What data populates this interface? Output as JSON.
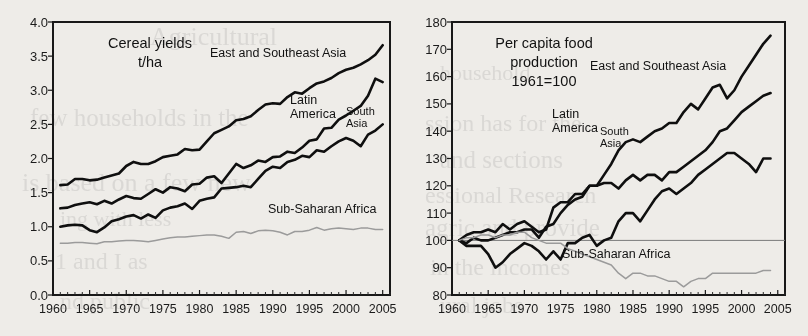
{
  "page": {
    "background_color": "#eceae6",
    "line_color_dark": "#111111",
    "line_color_light": "#9a9a9a"
  },
  "bleed_text": [
    {
      "text": "Agricultural",
      "x": 150,
      "y": 22,
      "size": 26
    },
    {
      "text": "few households in the",
      "x": 30,
      "y": 104,
      "size": 25
    },
    {
      "text": "is based on a few new",
      "x": 22,
      "y": 168,
      "size": 26
    },
    {
      "text": "ing with less",
      "x": 60,
      "y": 206,
      "size": 22
    },
    {
      "text": "1 and I as",
      "x": 55,
      "y": 248,
      "size": 24
    },
    {
      "text": "nd public",
      "x": 60,
      "y": 288,
      "size": 24
    },
    {
      "text": "household",
      "x": 440,
      "y": 60,
      "size": 22
    },
    {
      "text": "ssion has for the",
      "x": 425,
      "y": 110,
      "size": 24
    },
    {
      "text": "and sections",
      "x": 440,
      "y": 146,
      "size": 25
    },
    {
      "text": "essional Research",
      "x": 425,
      "y": 182,
      "size": 24
    },
    {
      "text": "agric and provide",
      "x": 425,
      "y": 214,
      "size": 25
    },
    {
      "text": "in the incomes",
      "x": 430,
      "y": 254,
      "size": 24
    },
    {
      "text": "ural jobs",
      "x": 440,
      "y": 292,
      "size": 24
    }
  ],
  "charts": [
    {
      "name": "cereal-yields-chart",
      "title_lines": [
        "Cereal yields",
        "t/ha"
      ],
      "ylabels": [
        "4.0",
        "3.5",
        "3.0",
        "2.5",
        "2.0",
        "1.5",
        "1.0",
        "0.5",
        "0.0"
      ],
      "xlabels": [
        "1960",
        "1965",
        "1970",
        "1975",
        "1980",
        "1985",
        "1990",
        "1995",
        "2000",
        "2005"
      ],
      "series_labels": [
        {
          "name": "east-southeast-asia",
          "lines": [
            "East and Southeast Asia"
          ]
        },
        {
          "name": "latin-america",
          "lines": [
            "Latin",
            "America"
          ]
        },
        {
          "name": "south-asia",
          "lines": [
            "South",
            "Asia"
          ]
        },
        {
          "name": "sub-saharan-africa",
          "lines": [
            "Sub-Saharan Africa"
          ]
        }
      ]
    },
    {
      "name": "per-capita-food-production-chart",
      "title_lines": [
        "Per capita food",
        "production",
        "1961=100"
      ],
      "ylabels": [
        "180",
        "170",
        "160",
        "150",
        "140",
        "130",
        "120",
        "110",
        "100",
        "90",
        "80"
      ],
      "xlabels": [
        "1960",
        "1965",
        "1970",
        "1975",
        "1980",
        "1985",
        "1990",
        "1995",
        "2000",
        "2005"
      ],
      "series_labels": [
        {
          "name": "east-southeast-asia",
          "lines": [
            "East and Southeast Asia"
          ]
        },
        {
          "name": "latin-america",
          "lines": [
            "Latin",
            "America"
          ]
        },
        {
          "name": "south-asia",
          "lines": [
            "South",
            "Asia"
          ]
        },
        {
          "name": "sub-saharan-africa",
          "lines": [
            "Sub-Saharan Africa"
          ]
        }
      ]
    }
  ],
  "chart_data": [
    {
      "type": "line",
      "title": "Cereal yields t/ha",
      "xlabel": "",
      "ylabel": "t/ha",
      "xlim": [
        1960,
        2006
      ],
      "ylim": [
        0.0,
        4.0
      ],
      "yticks": [
        0.0,
        0.5,
        1.0,
        1.5,
        2.0,
        2.5,
        3.0,
        3.5,
        4.0
      ],
      "xticks": [
        1960,
        1965,
        1970,
        1975,
        1980,
        1985,
        1990,
        1995,
        2000,
        2005
      ],
      "grid": false,
      "legend": "inline-annotations",
      "x": [
        1961,
        1962,
        1963,
        1964,
        1965,
        1966,
        1967,
        1968,
        1969,
        1970,
        1971,
        1972,
        1973,
        1974,
        1975,
        1976,
        1977,
        1978,
        1979,
        1980,
        1981,
        1982,
        1983,
        1984,
        1985,
        1986,
        1987,
        1988,
        1989,
        1990,
        1991,
        1992,
        1993,
        1994,
        1995,
        1996,
        1997,
        1998,
        1999,
        2000,
        2001,
        2002,
        2003,
        2004,
        2005
      ],
      "series": [
        {
          "name": "East and Southeast Asia",
          "color": "#111111",
          "values": [
            1.61,
            1.62,
            1.7,
            1.7,
            1.68,
            1.69,
            1.72,
            1.75,
            1.78,
            1.89,
            1.95,
            1.92,
            1.92,
            1.96,
            2.02,
            2.04,
            2.06,
            2.14,
            2.12,
            2.13,
            2.25,
            2.37,
            2.42,
            2.47,
            2.56,
            2.58,
            2.62,
            2.71,
            2.79,
            2.81,
            2.8,
            2.9,
            2.97,
            2.95,
            3.03,
            3.1,
            3.13,
            3.18,
            3.25,
            3.3,
            3.33,
            3.38,
            3.44,
            3.52,
            3.66
          ]
        },
        {
          "name": "Latin America",
          "color": "#111111",
          "values": [
            1.27,
            1.28,
            1.32,
            1.34,
            1.36,
            1.33,
            1.38,
            1.34,
            1.4,
            1.45,
            1.42,
            1.41,
            1.48,
            1.55,
            1.5,
            1.58,
            1.56,
            1.52,
            1.62,
            1.63,
            1.72,
            1.74,
            1.64,
            1.78,
            1.92,
            1.86,
            1.9,
            1.97,
            1.95,
            2.02,
            2.03,
            2.1,
            2.08,
            2.16,
            2.26,
            2.28,
            2.44,
            2.45,
            2.57,
            2.63,
            2.7,
            2.77,
            2.92,
            3.17,
            3.12
          ]
        },
        {
          "name": "South Asia",
          "color": "#111111",
          "values": [
            1.0,
            1.02,
            1.03,
            1.02,
            0.95,
            0.92,
            0.99,
            1.08,
            1.11,
            1.15,
            1.17,
            1.12,
            1.18,
            1.13,
            1.24,
            1.28,
            1.3,
            1.34,
            1.26,
            1.38,
            1.41,
            1.43,
            1.56,
            1.57,
            1.58,
            1.6,
            1.58,
            1.7,
            1.82,
            1.88,
            1.86,
            1.95,
            1.98,
            2.04,
            2.02,
            2.12,
            2.1,
            2.18,
            2.25,
            2.3,
            2.26,
            2.18,
            2.35,
            2.41,
            2.5
          ]
        },
        {
          "name": "Sub-Saharan Africa",
          "color": "#9a9a9a",
          "values": [
            0.76,
            0.76,
            0.77,
            0.77,
            0.76,
            0.75,
            0.78,
            0.78,
            0.79,
            0.8,
            0.8,
            0.79,
            0.78,
            0.8,
            0.82,
            0.84,
            0.85,
            0.85,
            0.86,
            0.87,
            0.88,
            0.88,
            0.86,
            0.83,
            0.92,
            0.93,
            0.9,
            0.94,
            0.95,
            0.94,
            0.92,
            0.88,
            0.93,
            0.93,
            0.95,
            0.99,
            0.95,
            0.97,
            0.98,
            0.97,
            0.96,
            0.98,
            0.98,
            0.96,
            0.96
          ]
        }
      ]
    },
    {
      "type": "line",
      "title": "Per capita food production 1961=100",
      "xlabel": "",
      "ylabel": "Index, 1961=100",
      "xlim": [
        1960,
        2006
      ],
      "ylim": [
        80,
        180
      ],
      "yticks": [
        80,
        90,
        100,
        110,
        120,
        130,
        140,
        150,
        160,
        170,
        180
      ],
      "xticks": [
        1960,
        1965,
        1970,
        1975,
        1980,
        1985,
        1990,
        1995,
        2000,
        2005
      ],
      "grid": false,
      "reference_line": 100,
      "legend": "inline-annotations",
      "x": [
        1961,
        1962,
        1963,
        1964,
        1965,
        1966,
        1967,
        1968,
        1969,
        1970,
        1971,
        1972,
        1973,
        1974,
        1975,
        1976,
        1977,
        1978,
        1979,
        1980,
        1981,
        1982,
        1983,
        1984,
        1985,
        1986,
        1987,
        1988,
        1989,
        1990,
        1991,
        1992,
        1993,
        1994,
        1995,
        1996,
        1997,
        1998,
        1999,
        2000,
        2001,
        2002,
        2003,
        2004
      ],
      "series": [
        {
          "name": "East and Southeast Asia",
          "color": "#111111",
          "values": [
            100,
            99,
            101,
            100,
            100,
            101,
            102,
            103,
            103,
            104,
            104,
            101,
            105,
            106,
            110,
            113,
            115,
            116,
            120,
            120,
            124,
            128,
            133,
            136,
            137,
            136,
            138,
            140,
            141,
            143,
            143,
            147,
            150,
            148,
            152,
            156,
            157,
            152,
            155,
            160,
            164,
            168,
            172,
            175
          ]
        },
        {
          "name": "Latin America",
          "color": "#111111",
          "values": [
            100,
            102,
            103,
            103,
            104,
            103,
            106,
            104,
            106,
            107,
            105,
            103,
            104,
            112,
            114,
            114,
            117,
            117,
            120,
            120,
            121,
            121,
            119,
            122,
            124,
            122,
            124,
            124,
            122,
            125,
            125,
            127,
            129,
            131,
            133,
            136,
            140,
            141,
            144,
            147,
            149,
            151,
            153,
            154
          ]
        },
        {
          "name": "South Asia",
          "color": "#111111",
          "values": [
            100,
            98,
            98,
            98,
            95,
            90,
            92,
            95,
            97,
            99,
            98,
            96,
            93,
            96,
            93,
            99,
            99,
            101,
            102,
            98,
            100,
            101,
            107,
            110,
            110,
            107,
            111,
            115,
            118,
            119,
            117,
            119,
            121,
            124,
            126,
            128,
            130,
            132,
            132,
            130,
            128,
            125,
            130,
            130
          ]
        },
        {
          "name": "Sub-Saharan Africa",
          "color": "#9a9a9a",
          "values": [
            100,
            101,
            101,
            102,
            102,
            101,
            102,
            102,
            103,
            103,
            101,
            100,
            99,
            99,
            99,
            97,
            96,
            95,
            94,
            93,
            92,
            91,
            88,
            86,
            88,
            88,
            87,
            87,
            86,
            85,
            85,
            83,
            85,
            86,
            86,
            88,
            88,
            88,
            88,
            88,
            88,
            88,
            89,
            89
          ]
        }
      ]
    }
  ]
}
